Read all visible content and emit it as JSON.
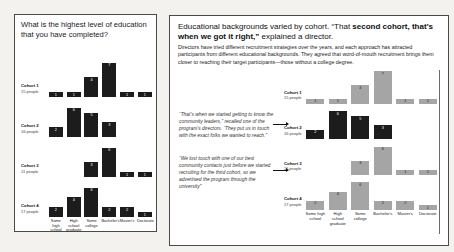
{
  "left_panel": {
    "title": "What is the highest level of education that you have completed?"
  },
  "right_panel": {
    "title_pre": "Educational backgrounds varied by cohort. “That ",
    "title_bold": "second cohort, that’s when we got it right,”",
    "title_post": " explained a director.",
    "body": "Directors have tried different recruitment strategies over the years, and each approach has attracted participants from different educational backgrounds.  They agreed that word-of-mouth recruitment brings them closer to reaching their target participants—those without a college degree.",
    "annotations": [
      {
        "text": "“That’s when we started getting to know the community leaders,” recalled one of the program’s directors. “They put us in touch with the exact folks we wanted to reach.”",
        "points_to": "Cohort 2"
      },
      {
        "text": "“We lost touch with one of our best community contacts just before we started recruiting for the third cohort, so we advertised the program through the university”",
        "points_to": "Cohort 3"
      }
    ]
  },
  "chart_data": {
    "type": "bar",
    "layout": "small multiples, one row per cohort, repeated in both panels",
    "title": "What is the highest level of education that you have completed?",
    "categories": [
      "Some high school",
      "High school graduate",
      "Some college",
      "Bachelor's",
      "Master's",
      "Doctorate"
    ],
    "series": [
      {
        "name": "Cohort 1",
        "size_label": "15 people",
        "values": [
          1,
          1,
          4,
          7,
          1,
          1
        ]
      },
      {
        "name": "Cohort 2",
        "size_label": "16 people",
        "values": [
          2,
          6,
          5,
          3,
          0,
          0
        ]
      },
      {
        "name": "Cohort 3",
        "size_label": "11 people",
        "values": [
          0,
          0,
          3,
          6,
          1,
          1
        ]
      },
      {
        "name": "Cohort 4",
        "size_label": "17 people",
        "values": [
          2,
          4,
          6,
          2,
          2,
          1
        ]
      }
    ],
    "ylim": [
      0,
      7
    ],
    "grid": false,
    "value_labels": true,
    "highlighted_cohort": "Cohort 2",
    "colors": {
      "bar_dark": "#1c1c1c",
      "bar_muted": "#a5a5a5",
      "value_label_on_dark": "#ffffff",
      "value_label_on_muted": "#1a1a1a"
    }
  }
}
